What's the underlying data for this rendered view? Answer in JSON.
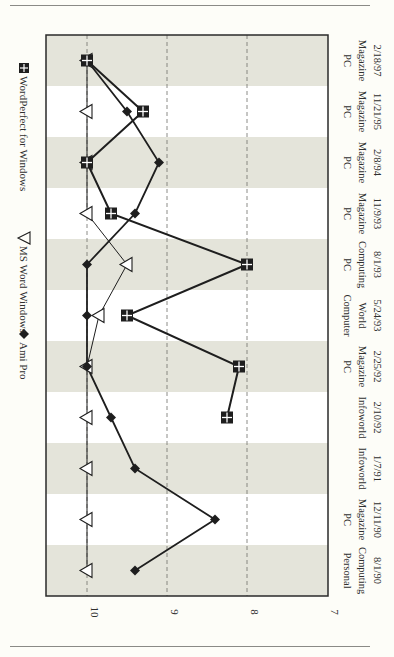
{
  "header": {
    "cut_text": "gy"
  },
  "chart_data": {
    "type": "line",
    "orientation": "rotated-90-clockwise",
    "title": "",
    "xlabel": "",
    "ylabel": "",
    "categories": [
      {
        "line1": "Personal",
        "line2": "Computing",
        "line3": "8/1/90"
      },
      {
        "line1": "PC",
        "line2": "Magazine",
        "line3": "12/11/90"
      },
      {
        "line1": "",
        "line2": "Infoworld",
        "line3": "1/7/91"
      },
      {
        "line1": "",
        "line2": "Infoworld",
        "line3": "2/10/92"
      },
      {
        "line1": "PC",
        "line2": "Magazine",
        "line3": "2/25/92"
      },
      {
        "line1": "Computer",
        "line2": "World",
        "line3": "5/24/93"
      },
      {
        "line1": "PC",
        "line2": "Computing",
        "line3": "8/1/93"
      },
      {
        "line1": "PC",
        "line2": "Magazine",
        "line3": "11/9/93"
      },
      {
        "line1": "PC",
        "line2": "Magazine",
        "line3": "2/8/94"
      },
      {
        "line1": "PC",
        "line2": "Magazine",
        "line3": "11/21/95"
      },
      {
        "line1": "PC",
        "line2": "Magazine",
        "line3": "2/18/97"
      }
    ],
    "series": [
      {
        "name": "Ami Pro",
        "marker": "diamond",
        "values": [
          9.4,
          8.4,
          9.4,
          9.7,
          10.0,
          10.0,
          10.0,
          9.4,
          9.1,
          9.5,
          10.0
        ]
      },
      {
        "name": "MS Word Windows",
        "marker": "triangle",
        "values": [
          10.0,
          10.0,
          10.0,
          10.0,
          10.0,
          9.85,
          9.5,
          10.0,
          10.0,
          10.0,
          10.0
        ]
      },
      {
        "name": "WordPerfect for Windows",
        "marker": "square-cross",
        "values": [
          null,
          null,
          null,
          8.25,
          8.1,
          9.5,
          8.0,
          9.7,
          10.0,
          9.3,
          10.0
        ]
      }
    ],
    "yticks": [
      "10",
      "9",
      "8",
      "7"
    ],
    "ylim": [
      7,
      10
    ],
    "grid": true,
    "legend_position": "left (rotated, top of chart)",
    "band_colors": {
      "shaded": "#e4e4da",
      "plain": "#ffffff"
    },
    "line_color": "#1e1e1e"
  },
  "legend": [
    {
      "label": "Ami Pro",
      "marker": "diamond"
    },
    {
      "label": "MS Word Windows",
      "marker": "triangle"
    },
    {
      "label": "WordPerfect for Windows",
      "marker": "square-cross"
    }
  ]
}
